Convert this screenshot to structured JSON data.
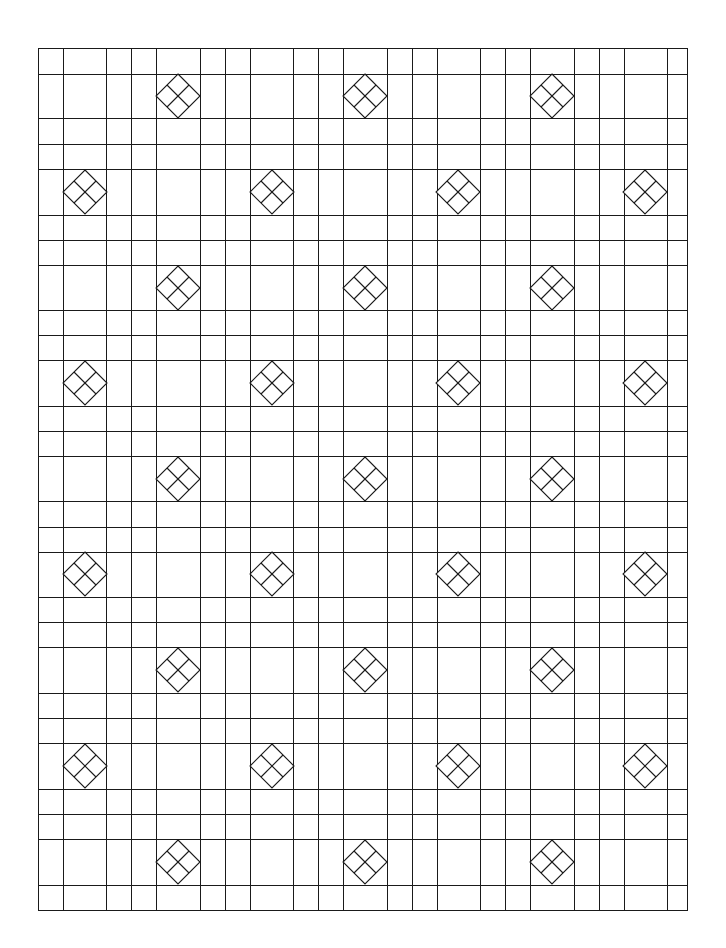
{
  "page": {
    "width": 726,
    "height": 948,
    "background": "#ffffff",
    "line_color": "#1a1a1a"
  },
  "pattern": {
    "name": "plaid grid with diamond motifs",
    "border": {
      "left": 38,
      "top": 48,
      "right": 687,
      "bottom": 910
    },
    "vertical_lines": [
      38,
      63,
      106,
      131,
      156,
      200,
      225,
      250,
      293,
      318,
      343,
      387,
      412,
      437,
      480,
      505,
      530,
      574,
      599,
      624,
      667,
      687
    ],
    "horizontal_lines": [
      48,
      74,
      118,
      144,
      169,
      215,
      240,
      265,
      310,
      335,
      360,
      406,
      431,
      456,
      501,
      527,
      552,
      597,
      622,
      647,
      693,
      718,
      743,
      789,
      814,
      839,
      885,
      910
    ],
    "diamond_half_size": 22,
    "diamonds": [
      {
        "cx": 178,
        "cy": 96
      },
      {
        "cx": 365,
        "cy": 96
      },
      {
        "cx": 552,
        "cy": 96
      },
      {
        "cx": 85,
        "cy": 192
      },
      {
        "cx": 272,
        "cy": 192
      },
      {
        "cx": 458,
        "cy": 192
      },
      {
        "cx": 645,
        "cy": 192
      },
      {
        "cx": 178,
        "cy": 288
      },
      {
        "cx": 365,
        "cy": 288
      },
      {
        "cx": 552,
        "cy": 288
      },
      {
        "cx": 85,
        "cy": 383
      },
      {
        "cx": 272,
        "cy": 383
      },
      {
        "cx": 458,
        "cy": 383
      },
      {
        "cx": 645,
        "cy": 383
      },
      {
        "cx": 178,
        "cy": 479
      },
      {
        "cx": 365,
        "cy": 479
      },
      {
        "cx": 552,
        "cy": 479
      },
      {
        "cx": 85,
        "cy": 574
      },
      {
        "cx": 272,
        "cy": 574
      },
      {
        "cx": 458,
        "cy": 574
      },
      {
        "cx": 645,
        "cy": 574
      },
      {
        "cx": 178,
        "cy": 670
      },
      {
        "cx": 365,
        "cy": 670
      },
      {
        "cx": 552,
        "cy": 670
      },
      {
        "cx": 85,
        "cy": 766
      },
      {
        "cx": 272,
        "cy": 766
      },
      {
        "cx": 458,
        "cy": 766
      },
      {
        "cx": 645,
        "cy": 766
      },
      {
        "cx": 178,
        "cy": 862
      },
      {
        "cx": 365,
        "cy": 862
      },
      {
        "cx": 552,
        "cy": 862
      }
    ]
  }
}
